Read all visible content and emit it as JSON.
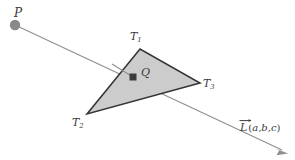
{
  "figure": {
    "type": "geometry-diagram",
    "background_color": "#ffffff",
    "colors": {
      "triangle_fill": "#cccccc",
      "triangle_stroke": "#333333",
      "ray_line": "#8f8f8f",
      "point_p_fill": "#8a8a8a",
      "point_q_fill": "#3b3b3b",
      "label_text": "#3a3a3a"
    },
    "points": {
      "P": {
        "label": "P",
        "x": 15,
        "y": 25,
        "radius": 5.2,
        "shape": "circle"
      },
      "Q": {
        "label": "Q",
        "x": 133,
        "y": 77,
        "size": 7,
        "shape": "square"
      }
    },
    "triangle": {
      "vertices": [
        {
          "label": "T",
          "subscript": "1",
          "x": 140,
          "y": 49
        },
        {
          "label": "T",
          "subscript": "2",
          "x": 87,
          "y": 114
        },
        {
          "label": "T",
          "subscript": "3",
          "x": 200,
          "y": 83
        }
      ]
    },
    "ray": {
      "from_x": 15,
      "from_y": 25,
      "to_x": 287,
      "to_y": 153,
      "arrowhead": true,
      "vector_label": "L",
      "vector_components_open": "(",
      "vector_components": "a,b,c",
      "vector_components_close": ")"
    }
  }
}
